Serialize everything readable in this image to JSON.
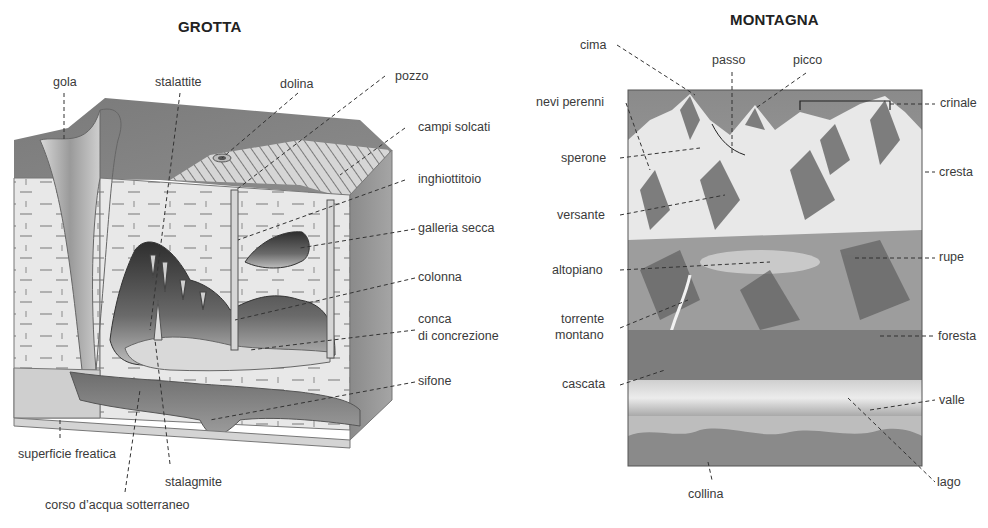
{
  "grotta": {
    "title": "GROTTA",
    "labels": {
      "gola": "gola",
      "stalattite": "stalattite",
      "dolina": "dolina",
      "pozzo": "pozzo",
      "campi_solcati": "campi solcati",
      "inghiottitoio": "inghiottitoio",
      "galleria_secca": "galleria secca",
      "colonna": "colonna",
      "conca_1": "conca",
      "conca_2": "di concrezione",
      "sifone": "sifone",
      "superficie_freatica": "superficie freatica",
      "stalagmite": "stalagmite",
      "corso_acqua": "corso d’acqua sotterraneo"
    }
  },
  "montagna": {
    "title": "MONTAGNA",
    "labels": {
      "cima": "cima",
      "passo": "passo",
      "picco": "picco",
      "nevi_perenni": "nevi perenni",
      "crinale": "crinale",
      "sperone": "sperone",
      "cresta": "cresta",
      "versante": "versante",
      "altopiano": "altopiano",
      "rupe": "rupe",
      "torrente_1": "torrente",
      "torrente_2": "montano",
      "foresta": "foresta",
      "cascata": "cascata",
      "valle": "valle",
      "lago": "lago",
      "collina": "collina"
    }
  },
  "colors": {
    "rock_dark": "#6e6e6e",
    "rock_mid": "#9a9a9a",
    "limestone": "#e6e6e6",
    "line": "#444444"
  }
}
